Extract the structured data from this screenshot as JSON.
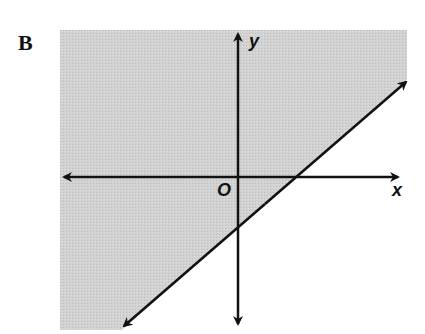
{
  "choice": {
    "label": "B"
  },
  "graph": {
    "x_axis_label": "x",
    "y_axis_label": "y",
    "origin_label": "O",
    "shade_color": "#cfcfcf",
    "line_color": "#111111",
    "boundary_line": {
      "slope": "positive",
      "style": "solid",
      "x_intercept": "positive",
      "y_intercept": "negative"
    },
    "shaded_side": "above-left of line"
  }
}
